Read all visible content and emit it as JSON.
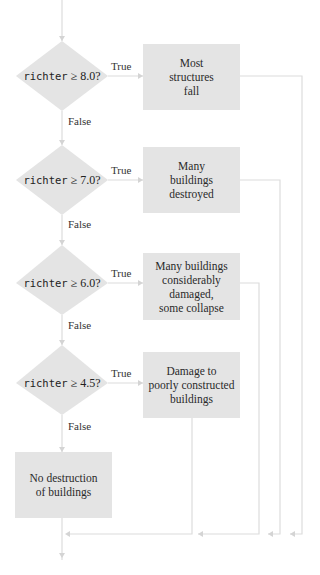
{
  "diagram": {
    "type": "flowchart",
    "colors": {
      "shape_fill": "#e4e4e4",
      "line": "#dcdcdc",
      "text": "#2a2a2a"
    },
    "decisions": [
      {
        "var": "richter",
        "op": "≥",
        "value": "8.0?",
        "true_label": "True",
        "false_label": "False"
      },
      {
        "var": "richter",
        "op": "≥",
        "value": "7.0?",
        "true_label": "True",
        "false_label": "False"
      },
      {
        "var": "richter",
        "op": "≥",
        "value": "6.0?",
        "true_label": "True",
        "false_label": "False"
      },
      {
        "var": "richter",
        "op": "≥",
        "value": "4.5?",
        "true_label": "True",
        "false_label": "False"
      }
    ],
    "outcomes": [
      {
        "text": "Most\nstructures\nfall"
      },
      {
        "text": "Many\nbuildings\ndestroyed"
      },
      {
        "text": "Many buildings\nconsiderably\ndamaged,\nsome collapse"
      },
      {
        "text": "Damage to\npoorly constructed\nbuildings"
      }
    ],
    "else_outcome": {
      "text": "No destruction\nof buildings"
    }
  }
}
